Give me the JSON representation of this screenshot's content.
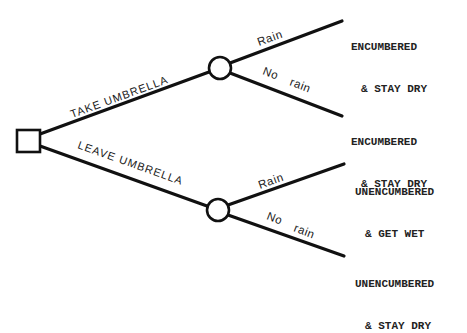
{
  "diagram": {
    "type": "decision-tree",
    "colors": {
      "line": "#111111",
      "text": "#1a1a1a",
      "background": "#ffffff"
    },
    "decision_node": {
      "shape": "square",
      "label": ""
    },
    "choices": [
      {
        "label": "TAKE UMBRELLA",
        "chance_node": {
          "shape": "circle"
        },
        "branches": [
          {
            "label": "Rain",
            "outcome_line1": "ENCUMBERED",
            "outcome_line2": "& STAY DRY"
          },
          {
            "label_word1": "No",
            "label_word2": "rain",
            "outcome_line1": "ENCUMBERED",
            "outcome_line2": "& STAY DRY"
          }
        ]
      },
      {
        "label": "LEAVE UMBRELLA",
        "chance_node": {
          "shape": "circle"
        },
        "branches": [
          {
            "label": "Rain",
            "outcome_line1": "UNENCUMBERED",
            "outcome_line2": "& GET WET"
          },
          {
            "label_word1": "No",
            "label_word2": "rain",
            "outcome_line1": "UNENCUMBERED",
            "outcome_line2": "& STAY DRY"
          }
        ]
      }
    ]
  }
}
